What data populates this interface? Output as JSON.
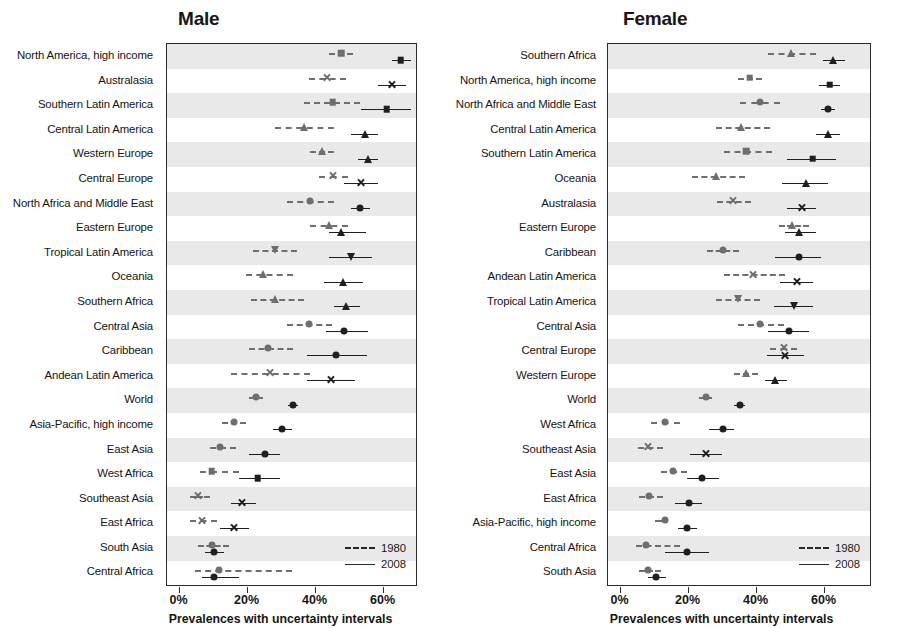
{
  "figure": {
    "cropped_header": "",
    "axis": {
      "tick_labels": [
        "0%",
        "20%",
        "40%",
        "60%"
      ],
      "tick_values": [
        0,
        20,
        40,
        60
      ],
      "xlabel": "Prevalences with uncertainty intervals",
      "xlim": [
        -3,
        70
      ]
    },
    "legend": {
      "items": [
        {
          "label": "1980",
          "style": "dashed"
        },
        {
          "label": "2008",
          "style": "solid"
        }
      ]
    }
  },
  "chart_data": [
    {
      "type": "scatter",
      "panel_id": "male",
      "title": "Male",
      "xlabel": "Prevalences with uncertainty intervals",
      "ylabel": "",
      "xlim": [
        -3,
        70
      ],
      "xticks": [
        0,
        20,
        40,
        60
      ],
      "xticklabels": [
        "0%",
        "20%",
        "40%",
        "60%"
      ],
      "grid": false,
      "legend_position": "bottom-right",
      "series_names": [
        "1980",
        "2008"
      ],
      "categories": [
        "North America, high income",
        "Australasia",
        "Southern Latin America",
        "Central Latin America",
        "Western Europe",
        "Central Europe",
        "North Africa and Middle East",
        "Eastern Europe",
        "Tropical Latin America",
        "Oceania",
        "Southern Africa",
        "Central Asia",
        "Caribbean",
        "Andean Latin America",
        "World",
        "Asia-Pacific, high income",
        "East Asia",
        "West Africa",
        "Southeast Asia",
        "East Africa",
        "South Asia",
        "Central Africa"
      ],
      "rows": [
        {
          "category": "North America, high income",
          "marker": "square",
          "y1980": {
            "value": 47.5,
            "low": 44.0,
            "high": 51.0
          },
          "y2008": {
            "value": 65.0,
            "low": 62.5,
            "high": 68.0
          }
        },
        {
          "category": "Australasia",
          "marker": "cross",
          "y1980": {
            "value": 43.5,
            "low": 38.0,
            "high": 49.0
          },
          "y2008": {
            "value": 62.5,
            "low": 58.5,
            "high": 66.5
          }
        },
        {
          "category": "Southern Latin America",
          "marker": "square",
          "y1980": {
            "value": 45.0,
            "low": 36.5,
            "high": 53.0
          },
          "y2008": {
            "value": 61.0,
            "low": 53.5,
            "high": 68.0
          }
        },
        {
          "category": "Central Latin America",
          "marker": "triangle",
          "y1980": {
            "value": 36.5,
            "low": 28.0,
            "high": 45.5
          },
          "y2008": {
            "value": 54.5,
            "low": 50.5,
            "high": 58.5
          }
        },
        {
          "category": "Western Europe",
          "marker": "triangle",
          "y1980": {
            "value": 42.0,
            "low": 38.5,
            "high": 45.5
          },
          "y2008": {
            "value": 55.5,
            "low": 52.5,
            "high": 58.5
          }
        },
        {
          "category": "Central Europe",
          "marker": "cross",
          "y1980": {
            "value": 45.0,
            "low": 41.0,
            "high": 49.5
          },
          "y2008": {
            "value": 53.5,
            "low": 48.5,
            "high": 58.5
          }
        },
        {
          "category": "North Africa and Middle East",
          "marker": "circle",
          "y1980": {
            "value": 38.5,
            "low": 31.5,
            "high": 45.5
          },
          "y2008": {
            "value": 53.0,
            "low": 50.5,
            "high": 56.0
          }
        },
        {
          "category": "Eastern Europe",
          "marker": "triangle",
          "y1980": {
            "value": 44.0,
            "low": 38.5,
            "high": 49.5
          },
          "y2008": {
            "value": 47.5,
            "low": 44.0,
            "high": 55.0
          }
        },
        {
          "category": "Tropical Latin America",
          "marker": "dtriangle",
          "y1980": {
            "value": 28.0,
            "low": 21.5,
            "high": 34.5
          },
          "y2008": {
            "value": 50.5,
            "low": 44.0,
            "high": 56.5
          }
        },
        {
          "category": "Oceania",
          "marker": "triangle",
          "y1980": {
            "value": 24.5,
            "low": 19.5,
            "high": 33.5
          },
          "y2008": {
            "value": 48.0,
            "low": 42.5,
            "high": 54.0
          }
        },
        {
          "category": "Southern Africa",
          "marker": "triangle",
          "y1980": {
            "value": 28.0,
            "low": 21.0,
            "high": 36.5
          },
          "y2008": {
            "value": 49.0,
            "low": 45.5,
            "high": 53.0
          }
        },
        {
          "category": "Central Asia",
          "marker": "circle",
          "y1980": {
            "value": 38.0,
            "low": 31.5,
            "high": 45.0
          },
          "y2008": {
            "value": 48.5,
            "low": 43.0,
            "high": 55.5
          }
        },
        {
          "category": "Caribbean",
          "marker": "circle",
          "y1980": {
            "value": 26.0,
            "low": 20.5,
            "high": 33.5
          },
          "y2008": {
            "value": 46.0,
            "low": 37.5,
            "high": 55.0
          }
        },
        {
          "category": "Andean Latin America",
          "marker": "cross",
          "y1980": {
            "value": 26.5,
            "low": 15.0,
            "high": 38.5
          },
          "y2008": {
            "value": 44.5,
            "low": 37.5,
            "high": 51.5
          }
        },
        {
          "category": "World",
          "marker": "circle",
          "y1980": {
            "value": 22.5,
            "low": 20.5,
            "high": 24.5
          },
          "y2008": {
            "value": 33.5,
            "low": 32.0,
            "high": 35.0
          }
        },
        {
          "category": "Asia-Pacific, high income",
          "marker": "circle",
          "y1980": {
            "value": 16.0,
            "low": 12.5,
            "high": 19.5
          },
          "y2008": {
            "value": 30.0,
            "low": 27.5,
            "high": 33.0
          }
        },
        {
          "category": "East Asia",
          "marker": "circle",
          "y1980": {
            "value": 12.0,
            "low": 9.0,
            "high": 16.5
          },
          "y2008": {
            "value": 25.0,
            "low": 20.5,
            "high": 29.5
          }
        },
        {
          "category": "West Africa",
          "marker": "square",
          "y1980": {
            "value": 9.5,
            "low": 6.0,
            "high": 17.5
          },
          "y2008": {
            "value": 23.0,
            "low": 17.5,
            "high": 29.5
          }
        },
        {
          "category": "Southeast Asia",
          "marker": "cross",
          "y1980": {
            "value": 5.5,
            "low": 3.0,
            "high": 9.0
          },
          "y2008": {
            "value": 18.5,
            "low": 15.0,
            "high": 22.5
          }
        },
        {
          "category": "East Africa",
          "marker": "cross",
          "y1980": {
            "value": 6.5,
            "low": 3.0,
            "high": 11.0
          },
          "y2008": {
            "value": 16.0,
            "low": 12.0,
            "high": 20.5
          }
        },
        {
          "category": "South Asia",
          "marker": "circle",
          "y1980": {
            "value": 9.5,
            "low": 5.5,
            "high": 14.5
          },
          "y2008": {
            "value": 10.0,
            "low": 7.5,
            "high": 13.0
          }
        },
        {
          "category": "Central Africa",
          "marker": "circle",
          "y1980": {
            "value": 11.5,
            "low": 4.5,
            "high": 33.0
          },
          "y2008": {
            "value": 10.0,
            "low": 6.5,
            "high": 17.5
          }
        }
      ]
    },
    {
      "type": "scatter",
      "panel_id": "female",
      "title": "Female",
      "xlabel": "Prevalences with uncertainty intervals",
      "ylabel": "",
      "xlim": [
        -3,
        70
      ],
      "xticks": [
        0,
        20,
        40,
        60
      ],
      "xticklabels": [
        "0%",
        "20%",
        "40%",
        "60%"
      ],
      "grid": false,
      "legend_position": "bottom-right",
      "series_names": [
        "1980",
        "2008"
      ],
      "categories": [
        "Southern Africa",
        "North America, high income",
        "North Africa and Middle East",
        "Central Latin America",
        "Southern Latin America",
        "Oceania",
        "Australasia",
        "Eastern Europe",
        "Caribbean",
        "Andean Latin America",
        "Tropical Latin America",
        "Central Asia",
        "Central Europe",
        "Western Europe",
        "World",
        "West Africa",
        "Southeast Asia",
        "East Asia",
        "East Africa",
        "Asia-Pacific, high income",
        "Central Africa",
        "South Asia"
      ],
      "rows": [
        {
          "category": "Southern Africa",
          "marker": "triangle",
          "y1980": {
            "value": 50.0,
            "low": 43.5,
            "high": 57.5
          },
          "y2008": {
            "value": 62.5,
            "low": 59.5,
            "high": 66.0
          }
        },
        {
          "category": "North America, high income",
          "marker": "square",
          "y1980": {
            "value": 38.0,
            "low": 34.5,
            "high": 41.5
          },
          "y2008": {
            "value": 61.5,
            "low": 58.5,
            "high": 64.5
          }
        },
        {
          "category": "North Africa and Middle East",
          "marker": "circle",
          "y1980": {
            "value": 41.0,
            "low": 35.0,
            "high": 47.0
          },
          "y2008": {
            "value": 61.0,
            "low": 59.0,
            "high": 63.0
          }
        },
        {
          "category": "Central Latin America",
          "marker": "triangle",
          "y1980": {
            "value": 35.5,
            "low": 28.0,
            "high": 44.0
          },
          "y2008": {
            "value": 61.0,
            "low": 57.5,
            "high": 64.5
          }
        },
        {
          "category": "Southern Latin America",
          "marker": "square",
          "y1980": {
            "value": 37.0,
            "low": 30.5,
            "high": 44.5
          },
          "y2008": {
            "value": 56.5,
            "low": 49.0,
            "high": 63.5
          }
        },
        {
          "category": "Oceania",
          "marker": "triangle",
          "y1980": {
            "value": 28.0,
            "low": 21.0,
            "high": 36.5
          },
          "y2008": {
            "value": 54.5,
            "low": 47.5,
            "high": 61.0
          }
        },
        {
          "category": "Australasia",
          "marker": "cross",
          "y1980": {
            "value": 33.0,
            "low": 28.5,
            "high": 38.5
          },
          "y2008": {
            "value": 53.5,
            "low": 49.0,
            "high": 57.5
          }
        },
        {
          "category": "Eastern Europe",
          "marker": "triangle",
          "y1980": {
            "value": 50.5,
            "low": 46.5,
            "high": 55.5
          },
          "y2008": {
            "value": 52.5,
            "low": 48.5,
            "high": 57.5
          }
        },
        {
          "category": "Caribbean",
          "marker": "circle",
          "y1980": {
            "value": 30.0,
            "low": 25.5,
            "high": 35.0
          },
          "y2008": {
            "value": 52.5,
            "low": 45.5,
            "high": 59.0
          }
        },
        {
          "category": "Andean Latin America",
          "marker": "cross",
          "y1980": {
            "value": 39.0,
            "low": 30.5,
            "high": 48.5
          },
          "y2008": {
            "value": 52.0,
            "low": 47.0,
            "high": 56.5
          }
        },
        {
          "category": "Tropical Latin America",
          "marker": "dtriangle",
          "y1980": {
            "value": 34.5,
            "low": 28.0,
            "high": 41.0
          },
          "y2008": {
            "value": 51.0,
            "low": 45.0,
            "high": 56.5
          }
        },
        {
          "category": "Central Asia",
          "marker": "circle",
          "y1980": {
            "value": 41.0,
            "low": 34.5,
            "high": 48.0
          },
          "y2008": {
            "value": 49.5,
            "low": 43.5,
            "high": 55.5
          }
        },
        {
          "category": "Central Europe",
          "marker": "cross",
          "y1980": {
            "value": 48.0,
            "low": 44.0,
            "high": 52.0
          },
          "y2008": {
            "value": 48.5,
            "low": 43.0,
            "high": 54.0
          }
        },
        {
          "category": "Western Europe",
          "marker": "triangle",
          "y1980": {
            "value": 37.0,
            "low": 33.5,
            "high": 40.5
          },
          "y2008": {
            "value": 45.5,
            "low": 42.5,
            "high": 49.0
          }
        },
        {
          "category": "World",
          "marker": "circle",
          "y1980": {
            "value": 25.0,
            "low": 23.0,
            "high": 27.0
          },
          "y2008": {
            "value": 35.0,
            "low": 33.5,
            "high": 36.5
          }
        },
        {
          "category": "West Africa",
          "marker": "circle",
          "y1980": {
            "value": 13.0,
            "low": 9.0,
            "high": 17.5
          },
          "y2008": {
            "value": 30.0,
            "low": 26.0,
            "high": 33.5
          }
        },
        {
          "category": "Southeast Asia",
          "marker": "cross",
          "y1980": {
            "value": 8.0,
            "low": 5.0,
            "high": 12.5
          },
          "y2008": {
            "value": 25.0,
            "low": 20.5,
            "high": 30.0
          }
        },
        {
          "category": "East Asia",
          "marker": "circle",
          "y1980": {
            "value": 15.5,
            "low": 12.0,
            "high": 19.5
          },
          "y2008": {
            "value": 24.0,
            "low": 19.5,
            "high": 29.0
          }
        },
        {
          "category": "East Africa",
          "marker": "circle",
          "y1980": {
            "value": 8.5,
            "low": 5.5,
            "high": 12.5
          },
          "y2008": {
            "value": 20.0,
            "low": 16.0,
            "high": 24.0
          }
        },
        {
          "category": "Asia-Pacific, high income",
          "marker": "circle",
          "y1980": {
            "value": 13.0,
            "low": 10.0,
            "high": 13.5
          },
          "y2008": {
            "value": 19.5,
            "low": 17.0,
            "high": 22.5
          }
        },
        {
          "category": "Central Africa",
          "marker": "circle",
          "y1980": {
            "value": 7.5,
            "low": 4.5,
            "high": 17.5
          },
          "y2008": {
            "value": 19.5,
            "low": 13.0,
            "high": 26.0
          }
        },
        {
          "category": "South Asia",
          "marker": "circle",
          "y1980": {
            "value": 8.0,
            "low": 5.5,
            "high": 12.0
          },
          "y2008": {
            "value": 10.5,
            "low": 8.0,
            "high": 13.5
          }
        }
      ]
    }
  ],
  "colors": {
    "series_1980": "#6e6e6e",
    "series_2008": "#1f1f1f",
    "band": "#e9e9e9",
    "axis": "#2a2a2a",
    "text": "#141414"
  }
}
